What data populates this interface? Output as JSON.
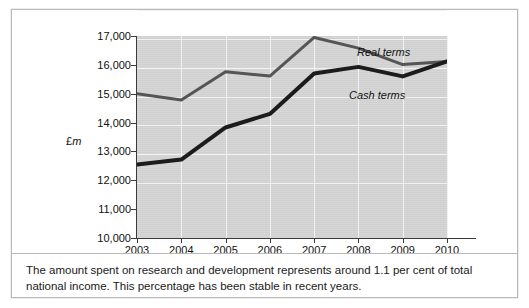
{
  "figure": {
    "caption": "The amount spent on research and development represents around 1.1 per cent of total national income. This percentage has been stable in recent years.",
    "border_color": "#b9b9b9",
    "plot_background_color": "#d2d2d2",
    "gridline_color": "#f2f2f2"
  },
  "chart_data": {
    "type": "line",
    "title": "",
    "xlabel": "",
    "ylabel": "£m",
    "categories": [
      "2003",
      "2004",
      "2005",
      "2006",
      "2007",
      "2008",
      "2009",
      "2010"
    ],
    "x": [
      2003,
      2004,
      2005,
      2006,
      2007,
      2008,
      2009,
      2010
    ],
    "ylim": [
      10000,
      17000
    ],
    "ytick_step": 1000,
    "yticks": [
      10000,
      11000,
      12000,
      13000,
      14000,
      15000,
      16000,
      17000
    ],
    "ytick_labels": [
      "10,000",
      "11,000",
      "12,000",
      "13,000",
      "14,000",
      "15,000",
      "16,000",
      "17,000"
    ],
    "grid": true,
    "legend_position": "inline-annotation",
    "series": [
      {
        "name": "Real terms",
        "values": [
          15000,
          14780,
          15760,
          15610,
          16950,
          16580,
          16010,
          16120
        ],
        "color": "#555555",
        "line_width": 3
      },
      {
        "name": "Cash terms",
        "values": [
          12550,
          12720,
          13830,
          14300,
          15700,
          15930,
          15600,
          16120
        ],
        "color": "#1c1c1c",
        "line_width": 4
      }
    ],
    "annotations": [
      {
        "text": "Real terms",
        "series": "Real terms"
      },
      {
        "text": "Cash terms",
        "series": "Cash terms"
      }
    ]
  }
}
